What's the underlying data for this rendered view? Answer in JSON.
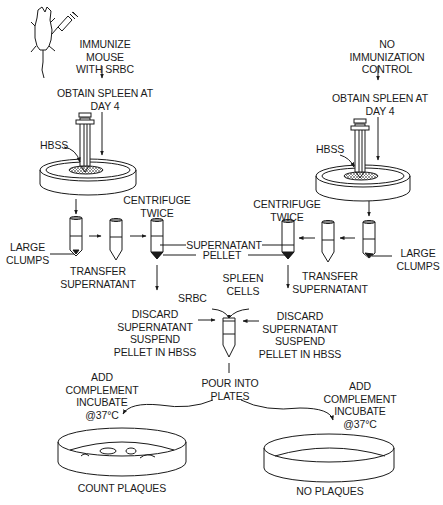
{
  "diagram": {
    "type": "flowchart",
    "colors": {
      "ink": "#1a1a1a",
      "background": "#ffffff",
      "mesh": "#555555"
    },
    "left_branch": {
      "step1": "IMMUNIZE MOUSE\nWITH SRBC",
      "step2": "OBTAIN SPLEEN AT\nDAY 4",
      "hbss": "HBSS",
      "large_clumps": "LARGE\nCLUMPS",
      "transfer": "TRANSFER\nSUPERNATANT",
      "centrifuge": "CENTRIFUGE\nTWICE",
      "discard": "DISCARD\nSUPERNATANT\nSUSPEND\nPELLET IN HBSS",
      "add_complement": "ADD\nCOMPLEMENT\nINCUBATE\n@37°C",
      "result": "COUNT PLAQUES"
    },
    "right_branch": {
      "step1": "NO IMMUNIZATION\nCONTROL",
      "step2": "OBTAIN SPLEEN AT\nDAY 4",
      "hbss": "HBSS",
      "large_clumps": "LARGE\nCLUMPS",
      "transfer": "TRANSFER\nSUPERNATANT",
      "centrifuge": "CENTRIFUGE\nTWICE",
      "discard": "DISCARD\nSUPERNATANT\nSUSPEND\nPELLET IN HBSS",
      "add_complement": "ADD\nCOMPLEMENT\nINCUBATE\n@37°C",
      "result": "NO PLAQUES"
    },
    "shared": {
      "supernatant": "SUPERNATANT",
      "pellet": "PELLET",
      "srbc": "SRBC",
      "spleen_cells": "SPLEEN\nCELLS",
      "pour": "POUR INTO\nPLATES"
    },
    "icons": [
      "mouse-icon",
      "syringe-icon",
      "petri-dish-icon",
      "test-tube-icon",
      "arrow-icon"
    ]
  }
}
